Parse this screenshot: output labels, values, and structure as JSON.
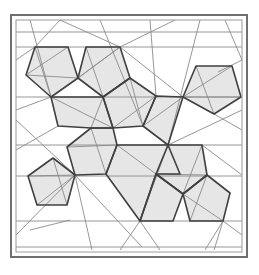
{
  "diagram": {
    "width": 259,
    "height": 275,
    "colors": {
      "background": "#ffffff",
      "frame": "#707070",
      "fill": "#e6e6e6",
      "outline": "#404040",
      "crease": "#8a8a8a"
    },
    "frame": {
      "outer": [
        11,
        15,
        236,
        242
      ],
      "inner": [
        16,
        20,
        226,
        232
      ]
    },
    "pentagons": [
      [
        [
          35,
          47
        ],
        [
          68,
          47
        ],
        [
          78,
          78
        ],
        [
          51,
          97
        ],
        [
          26,
          75
        ]
      ],
      [
        [
          86,
          47
        ],
        [
          120,
          47
        ],
        [
          130,
          78
        ],
        [
          103,
          97
        ],
        [
          78,
          78
        ]
      ],
      [
        [
          51,
          97
        ],
        [
          103,
          97
        ],
        [
          113,
          128
        ],
        [
          91,
          128
        ],
        [
          58,
          126
        ]
      ],
      [
        [
          103,
          97
        ],
        [
          130,
          78
        ],
        [
          156,
          96
        ],
        [
          143,
          126
        ],
        [
          113,
          128
        ]
      ],
      [
        [
          196,
          66
        ],
        [
          232,
          66
        ],
        [
          241,
          97
        ],
        [
          214,
          114
        ],
        [
          183,
          97
        ]
      ],
      [
        [
          156,
          96
        ],
        [
          183,
          97
        ],
        [
          168,
          145
        ],
        [
          143,
          126
        ]
      ],
      [
        [
          91,
          128
        ],
        [
          113,
          128
        ],
        [
          117,
          145
        ],
        [
          106,
          174
        ],
        [
          75,
          175
        ],
        [
          67,
          147
        ]
      ],
      [
        [
          53,
          158
        ],
        [
          75,
          175
        ],
        [
          67,
          205
        ],
        [
          37,
          205
        ],
        [
          28,
          176
        ]
      ],
      [
        [
          117,
          145
        ],
        [
          168,
          145
        ],
        [
          180,
          174
        ],
        [
          156,
          174
        ],
        [
          140,
          221
        ],
        [
          106,
          174
        ]
      ],
      [
        [
          168,
          145
        ],
        [
          202,
          145
        ],
        [
          207,
          175
        ],
        [
          183,
          194
        ],
        [
          156,
          174
        ]
      ],
      [
        [
          156,
          174
        ],
        [
          183,
          194
        ],
        [
          173,
          221
        ],
        [
          140,
          221
        ]
      ],
      [
        [
          183,
          194
        ],
        [
          207,
          175
        ],
        [
          230,
          193
        ],
        [
          223,
          221
        ],
        [
          190,
          221
        ]
      ]
    ],
    "crease_lines": [
      [
        [
          16,
          32
        ],
        [
          242,
          32
        ]
      ],
      [
        [
          16,
          47
        ],
        [
          242,
          47
        ]
      ],
      [
        [
          16,
          97
        ],
        [
          242,
          97
        ]
      ],
      [
        [
          16,
          145
        ],
        [
          242,
          145
        ]
      ],
      [
        [
          16,
          176
        ],
        [
          242,
          176
        ]
      ],
      [
        [
          16,
          221
        ],
        [
          242,
          221
        ]
      ],
      [
        [
          16,
          247
        ],
        [
          242,
          247
        ]
      ],
      [
        [
          26,
          75
        ],
        [
          78,
          78
        ]
      ],
      [
        [
          35,
          47
        ],
        [
          51,
          97
        ]
      ],
      [
        [
          68,
          47
        ],
        [
          26,
          75
        ]
      ],
      [
        [
          86,
          47
        ],
        [
          103,
          97
        ]
      ],
      [
        [
          120,
          47
        ],
        [
          78,
          78
        ]
      ],
      [
        [
          120,
          47
        ],
        [
          183,
          97
        ]
      ],
      [
        [
          120,
          47
        ],
        [
          60,
          20
        ]
      ],
      [
        [
          120,
          47
        ],
        [
          175,
          20
        ]
      ],
      [
        [
          120,
          47
        ],
        [
          78,
          78
        ]
      ],
      [
        [
          100,
          20
        ],
        [
          143,
          126
        ]
      ],
      [
        [
          51,
          97
        ],
        [
          113,
          128
        ]
      ],
      [
        [
          103,
          97
        ],
        [
          91,
          128
        ]
      ],
      [
        [
          58,
          126
        ],
        [
          16,
          150
        ]
      ],
      [
        [
          130,
          78
        ],
        [
          143,
          126
        ]
      ],
      [
        [
          156,
          96
        ],
        [
          113,
          128
        ]
      ],
      [
        [
          183,
          97
        ],
        [
          143,
          126
        ]
      ],
      [
        [
          183,
          97
        ],
        [
          241,
          97
        ]
      ],
      [
        [
          183,
          97
        ],
        [
          232,
          66
        ]
      ],
      [
        [
          196,
          66
        ],
        [
          214,
          114
        ]
      ],
      [
        [
          214,
          114
        ],
        [
          242,
          130
        ]
      ],
      [
        [
          225,
          20
        ],
        [
          242,
          60
        ]
      ],
      [
        [
          218,
          72
        ],
        [
          242,
          60
        ]
      ],
      [
        [
          67,
          147
        ],
        [
          117,
          145
        ]
      ],
      [
        [
          91,
          128
        ],
        [
          106,
          174
        ]
      ],
      [
        [
          75,
          175
        ],
        [
          28,
          176
        ]
      ],
      [
        [
          53,
          158
        ],
        [
          67,
          205
        ]
      ],
      [
        [
          37,
          205
        ],
        [
          75,
          175
        ]
      ],
      [
        [
          75,
          175
        ],
        [
          16,
          120
        ]
      ],
      [
        [
          75,
          175
        ],
        [
          92,
          250
        ]
      ],
      [
        [
          75,
          175
        ],
        [
          142,
          247
        ]
      ],
      [
        [
          75,
          175
        ],
        [
          16,
          235
        ]
      ],
      [
        [
          30,
          230
        ],
        [
          70,
          220
        ]
      ],
      [
        [
          117,
          145
        ],
        [
          156,
          174
        ]
      ],
      [
        [
          168,
          145
        ],
        [
          140,
          221
        ]
      ],
      [
        [
          156,
          174
        ],
        [
          207,
          175
        ]
      ],
      [
        [
          202,
          145
        ],
        [
          183,
          194
        ]
      ],
      [
        [
          183,
          194
        ],
        [
          223,
          221
        ]
      ],
      [
        [
          207,
          175
        ],
        [
          190,
          221
        ]
      ],
      [
        [
          223,
          221
        ],
        [
          242,
          235
        ]
      ],
      [
        [
          223,
          221
        ],
        [
          214,
          250
        ]
      ],
      [
        [
          223,
          221
        ],
        [
          205,
          250
        ]
      ],
      [
        [
          140,
          221
        ],
        [
          160,
          250
        ]
      ],
      [
        [
          140,
          221
        ],
        [
          120,
          250
        ]
      ],
      [
        [
          106,
          174
        ],
        [
          140,
          221
        ]
      ],
      [
        [
          168,
          145
        ],
        [
          242,
          110
        ]
      ],
      [
        [
          202,
          145
        ],
        [
          242,
          175
        ]
      ],
      [
        [
          16,
          60
        ],
        [
          35,
          47
        ]
      ],
      [
        [
          16,
          110
        ],
        [
          51,
          97
        ]
      ],
      [
        [
          30,
          20
        ],
        [
          51,
          97
        ]
      ],
      [
        [
          60,
          20
        ],
        [
          35,
          47
        ]
      ],
      [
        [
          150,
          20
        ],
        [
          156,
          96
        ]
      ],
      [
        [
          200,
          20
        ],
        [
          168,
          145
        ]
      ]
    ]
  }
}
